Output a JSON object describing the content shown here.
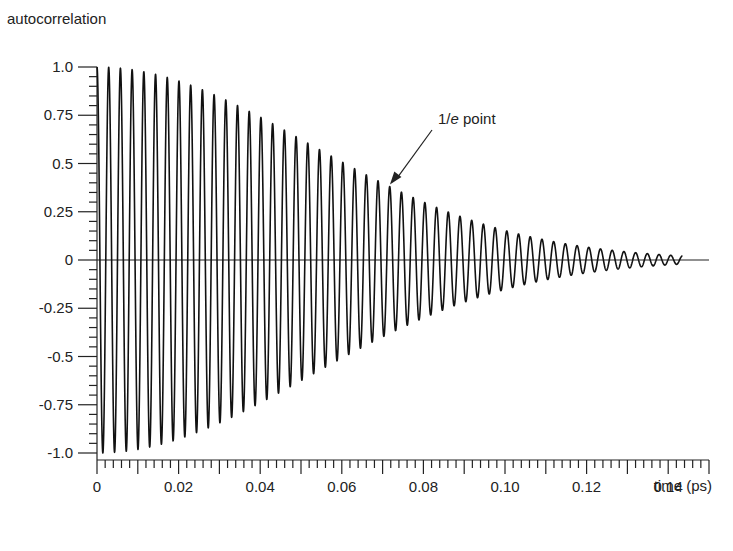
{
  "chart_data": {
    "type": "line",
    "title": "",
    "ylabel": "autocorrelation",
    "xlabel": "time (ps)",
    "xlim": [
      0,
      0.15
    ],
    "ylim": [
      -1.0,
      1.0
    ],
    "grid": false,
    "x_ticks": [
      0,
      0.02,
      0.04,
      0.06,
      0.08,
      0.1,
      0.12,
      0.14
    ],
    "x_tick_labels": [
      "0",
      "0.02",
      "0.04",
      "0.06",
      "0.08",
      "0.10",
      "0.12",
      "0.14"
    ],
    "x_major_step": 0.01,
    "x_minor_step": 0.002,
    "y_ticks": [
      1.0,
      0.75,
      0.5,
      0.25,
      0,
      -0.25,
      -0.5,
      -0.75,
      -1.0
    ],
    "y_tick_labels": [
      "1.0",
      "0.75",
      "0.5",
      "0.25",
      "0",
      "-0.25",
      "-0.5",
      "-0.75",
      "-1.0"
    ],
    "y_minor_step": 0.05,
    "series": [
      {
        "name": "autocorrelation",
        "description": "Cosine oscillation under a decaying Gaussian envelope",
        "function": "exp(-(t/tau)^2) * cos(2*pi*t/period)",
        "tau_ps": 0.073,
        "period_ps": 0.00287,
        "t_start": 0,
        "t_end": 0.1435,
        "envelope_samples": [
          {
            "t": 0.0,
            "amplitude": 1.0
          },
          {
            "t": 0.02,
            "amplitude": 0.93
          },
          {
            "t": 0.04,
            "amplitude": 0.76
          },
          {
            "t": 0.06,
            "amplitude": 0.52
          },
          {
            "t": 0.072,
            "amplitude": 0.37
          },
          {
            "t": 0.08,
            "amplitude": 0.3
          },
          {
            "t": 0.1,
            "amplitude": 0.16
          },
          {
            "t": 0.12,
            "amplitude": 0.07
          },
          {
            "t": 0.14,
            "amplitude": 0.03
          }
        ]
      }
    ],
    "zero_line_end": 0.15,
    "annotations": [
      {
        "text_prefix": "1/",
        "text_italic": "e",
        "text_suffix": " point",
        "points_to": {
          "t": 0.0718,
          "value": 0.37
        }
      }
    ]
  }
}
